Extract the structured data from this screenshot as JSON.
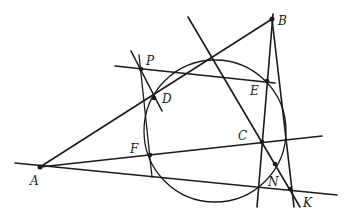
{
  "diagram": {
    "type": "geometry-construction",
    "colors": {
      "stroke": "#1a1a1a",
      "background": "#ffffff"
    },
    "points": {
      "A": {
        "label": "A",
        "x": 40,
        "y": 167
      },
      "B": {
        "label": "B",
        "x": 272,
        "y": 19
      },
      "C": {
        "label": "C",
        "x": 262,
        "y": 142
      },
      "D": {
        "label": "D",
        "x": 154,
        "y": 98
      },
      "E": {
        "label": "E",
        "x": 267,
        "y": 81
      },
      "F": {
        "label": "F",
        "x": 150,
        "y": 155
      },
      "N": {
        "label": "N",
        "x": 275,
        "y": 164
      },
      "K": {
        "label": "K",
        "x": 290,
        "y": 189
      },
      "P": {
        "label": "P",
        "x": 141,
        "y": 69
      }
    },
    "circle": {
      "cx": 215,
      "cy": 130,
      "r": 72
    }
  }
}
